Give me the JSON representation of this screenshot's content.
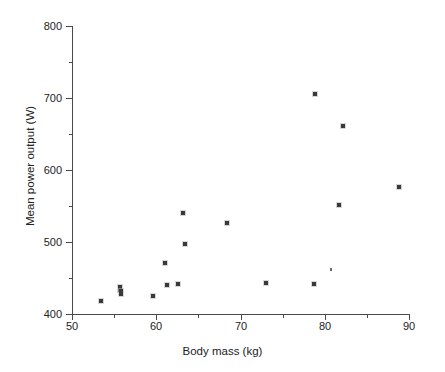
{
  "figure": {
    "background_color": "#ffffff",
    "axis_color": "#4a4a4a",
    "marker_color": "#3a3a3a"
  },
  "chart_data": {
    "type": "scatter",
    "title": "",
    "xlabel": "Body mass (kg)",
    "ylabel": "Mean power output  (W)",
    "xlim": [
      50,
      90
    ],
    "ylim": [
      400,
      800
    ],
    "grid": false,
    "legend": null,
    "x_ticks": [
      50,
      60,
      70,
      80,
      90
    ],
    "x_tick_labels": [
      "50",
      "60",
      "70",
      "80",
      "90"
    ],
    "x_minor_ticks": [
      55,
      65,
      75,
      85
    ],
    "y_ticks": [
      400,
      500,
      600,
      700,
      800
    ],
    "y_tick_labels": [
      "400",
      "500",
      "600",
      "700",
      "800"
    ],
    "y_minor_ticks": [
      450,
      550,
      650,
      750
    ],
    "series": [
      {
        "name": "athletes",
        "marker": "square",
        "points": [
          {
            "x": 53.5,
            "y": 418,
            "size": "normal"
          },
          {
            "x": 55.7,
            "y": 436,
            "size": "tall"
          },
          {
            "x": 55.8,
            "y": 430,
            "size": "tall"
          },
          {
            "x": 59.6,
            "y": 425,
            "size": "normal"
          },
          {
            "x": 61.0,
            "y": 471,
            "size": "normal"
          },
          {
            "x": 61.3,
            "y": 440,
            "size": "normal"
          },
          {
            "x": 62.6,
            "y": 442,
            "size": "normal"
          },
          {
            "x": 63.2,
            "y": 540,
            "size": "normal"
          },
          {
            "x": 63.4,
            "y": 497,
            "size": "normal"
          },
          {
            "x": 68.4,
            "y": 527,
            "size": "normal"
          },
          {
            "x": 73.0,
            "y": 443,
            "size": "normal"
          },
          {
            "x": 78.7,
            "y": 441,
            "size": "normal"
          },
          {
            "x": 78.9,
            "y": 706,
            "size": "normal"
          },
          {
            "x": 80.7,
            "y": 462,
            "size": "small"
          },
          {
            "x": 81.7,
            "y": 552,
            "size": "normal"
          },
          {
            "x": 82.2,
            "y": 661,
            "size": "normal"
          },
          {
            "x": 88.8,
            "y": 577,
            "size": "normal"
          }
        ]
      }
    ]
  }
}
